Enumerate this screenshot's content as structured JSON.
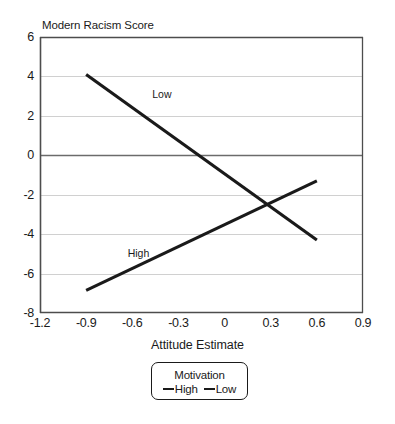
{
  "chart_data": {
    "type": "line",
    "title": "Modern Racism Score",
    "xlabel": "Attitude Estimate",
    "ylabel": "Modern Racism Score",
    "xlim": [
      -1.2,
      0.9
    ],
    "ylim": [
      -8,
      6
    ],
    "xticks": [
      "-1.2",
      "-0.9",
      "-0.6",
      "-0.3",
      "0",
      "0.3",
      "0.6",
      "0.9"
    ],
    "xtick_values": [
      -1.2,
      -0.9,
      -0.6,
      -0.3,
      0,
      0.3,
      0.6,
      0.9
    ],
    "yticks": [
      "6",
      "4",
      "2",
      "0",
      "-2",
      "-4",
      "-6",
      "-8"
    ],
    "ytick_values": [
      6,
      4,
      2,
      0,
      -2,
      -4,
      -6,
      -8
    ],
    "grid": "horizontal",
    "zero_line": true,
    "legend_position": "below-axis-title",
    "legend_title": "Motivation",
    "series": [
      {
        "name": "High",
        "color": "#1a1a1a",
        "annotation": "High",
        "annotation_at": [
          -0.63,
          -5.0
        ],
        "x": [
          -0.9,
          0.6
        ],
        "values": [
          -6.85,
          -1.3
        ]
      },
      {
        "name": "Low",
        "color": "#1a1a1a",
        "annotation": "Low",
        "annotation_at": [
          -0.47,
          3.05
        ],
        "x": [
          -0.9,
          0.6
        ],
        "values": [
          4.1,
          -4.3
        ]
      }
    ],
    "annotations": [
      "Low",
      "High"
    ]
  },
  "legend": {
    "title": "Motivation",
    "entries": [
      {
        "label": "High"
      },
      {
        "label": "Low"
      }
    ]
  },
  "colors": {
    "series_line": "#1a1a1a",
    "axis": "#4d4d4d",
    "grid": "#d0d0d0",
    "zero_line": "#6b6b6b",
    "background": "#ffffff",
    "text": "#1a1a1a"
  }
}
